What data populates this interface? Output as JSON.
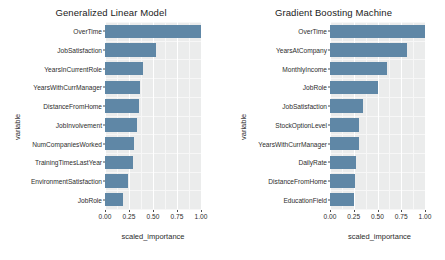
{
  "figure": {
    "background_color": "#ffffff",
    "panel_background_color": "#ebecec",
    "bar_color": "#5f87a6",
    "grid_color": "#ffffff"
  },
  "charts": [
    {
      "title": "Generalized Linear Model",
      "xlabel": "scaled_importance",
      "ylabel": "variable",
      "xticks": [
        "0.00",
        "0.25",
        "0.50",
        "0.75",
        "1.00"
      ]
    },
    {
      "title": "Gradient Boosting Machine",
      "xlabel": "scaled_importance",
      "ylabel": "variable",
      "xticks": [
        "0.00",
        "0.25",
        "0.50",
        "0.75",
        "1.00"
      ]
    }
  ],
  "chart_data": [
    {
      "type": "bar",
      "orientation": "horizontal",
      "title": "Generalized Linear Model",
      "xlabel": "scaled_importance",
      "ylabel": "variable",
      "xlim": [
        0,
        1
      ],
      "xticks": [
        0,
        0.25,
        0.5,
        0.75,
        1
      ],
      "xtick_labels": [
        "0.00",
        "0.25",
        "0.50",
        "0.75",
        "1.00"
      ],
      "grid": true,
      "legend": "none",
      "categories": [
        "OverTime",
        "JobSatisfaction",
        "YearsInCurrentRole",
        "YearsWithCurrManager",
        "DistanceFromHome",
        "JobInvolvement",
        "NumCompaniesWorked",
        "TrainingTimesLastYear",
        "EnvironmentSatisfaction",
        "JobRole"
      ],
      "values": [
        1.0,
        0.53,
        0.4,
        0.36,
        0.35,
        0.33,
        0.3,
        0.29,
        0.24,
        0.19
      ]
    },
    {
      "type": "bar",
      "orientation": "horizontal",
      "title": "Gradient Boosting Machine",
      "xlabel": "scaled_importance",
      "ylabel": "variable",
      "xlim": [
        0,
        1
      ],
      "xticks": [
        0,
        0.25,
        0.5,
        0.75,
        1
      ],
      "xtick_labels": [
        "0.00",
        "0.25",
        "0.50",
        "0.75",
        "1.00"
      ],
      "grid": true,
      "legend": "none",
      "categories": [
        "OverTime",
        "YearsAtCompany",
        "MonthlyIncome",
        "JobRole",
        "JobSatisfaction",
        "StockOptionLevel",
        "YearsWithCurrManager",
        "DailyRate",
        "DistanceFromHome",
        "EducationField"
      ],
      "values": [
        1.0,
        0.81,
        0.6,
        0.5,
        0.35,
        0.31,
        0.31,
        0.27,
        0.26,
        0.25
      ]
    }
  ]
}
